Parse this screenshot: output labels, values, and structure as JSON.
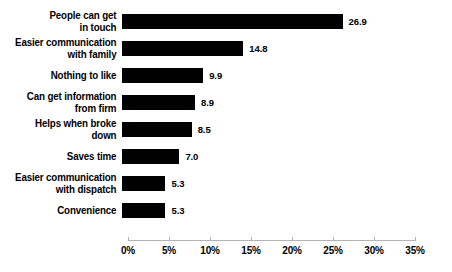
{
  "chart_data": {
    "type": "bar",
    "orientation": "horizontal",
    "title": "",
    "subtitle": "",
    "xlabel": "",
    "ylabel": "",
    "xlim": [
      0,
      35
    ],
    "grid": false,
    "legend": null,
    "categories": [
      "People can get\nin touch",
      "Easier communication\nwith family",
      "Nothing to like",
      "Can get information\nfrom firm",
      "Helps when broke\ndown",
      "Saves time",
      "Easier communication\nwith dispatch",
      "Convenience"
    ],
    "values": [
      26.9,
      14.8,
      9.9,
      8.9,
      8.5,
      7.0,
      5.3,
      5.3
    ],
    "value_labels": [
      "26.9",
      "14.8",
      "9.9",
      "8.9",
      "8.5",
      "7.0",
      "5.3",
      "5.3"
    ],
    "tick_values": [
      0,
      5,
      10,
      15,
      20,
      25,
      30,
      35
    ],
    "tick_labels": [
      "0%",
      "5%",
      "10%",
      "15%",
      "20%",
      "25%",
      "30%",
      "35%"
    ],
    "bar_color": "#000000",
    "axis_color": "#b4b4b4",
    "background_color": "#ffffff",
    "text_color": "#000000"
  }
}
